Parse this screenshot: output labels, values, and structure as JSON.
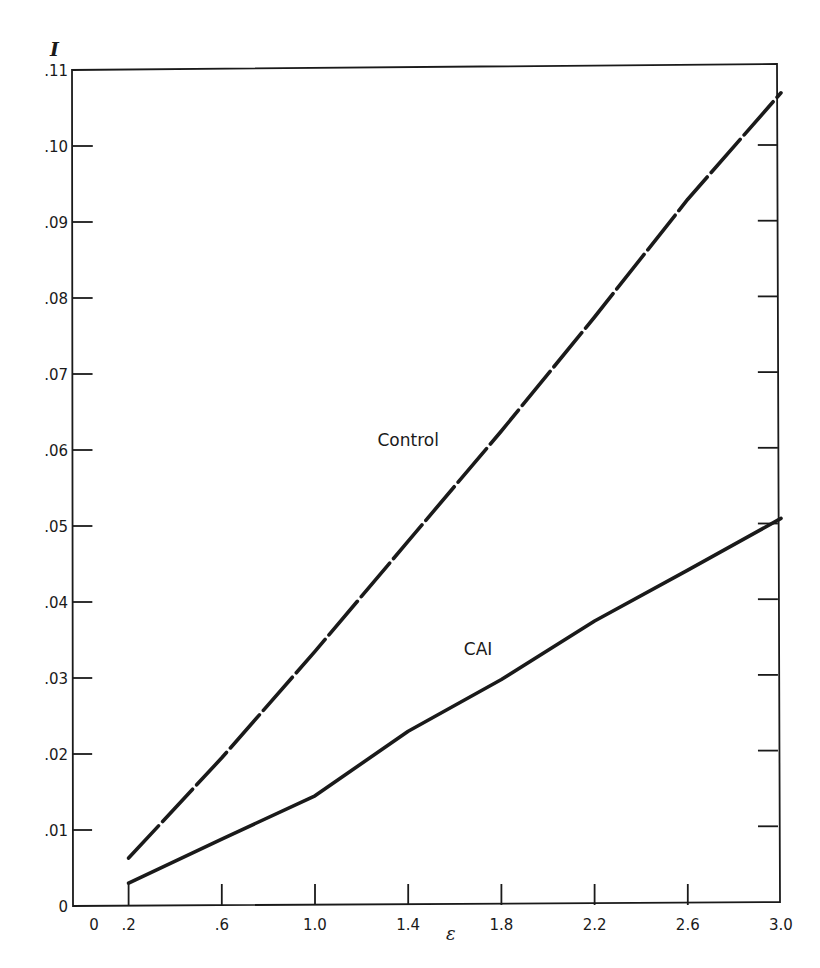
{
  "chart_data": {
    "type": "line",
    "title": "",
    "xlabel": "ε",
    "ylabel": "I",
    "xlim": [
      0,
      3.0
    ],
    "ylim": [
      0,
      0.11
    ],
    "grid": false,
    "legend": "inline labels",
    "x_ticks": [
      {
        "value": 0,
        "label": "0"
      },
      {
        "value": 0.2,
        "label": ".2"
      },
      {
        "value": 0.6,
        "label": ".6"
      },
      {
        "value": 1.0,
        "label": "1.0"
      },
      {
        "value": 1.4,
        "label": "1.4"
      },
      {
        "value": 1.8,
        "label": "1.8"
      },
      {
        "value": 2.2,
        "label": "2.2"
      },
      {
        "value": 2.6,
        "label": "2.6"
      },
      {
        "value": 3.0,
        "label": "3.0"
      }
    ],
    "y_ticks": [
      {
        "value": 0,
        "label": "0"
      },
      {
        "value": 0.01,
        "label": ".01"
      },
      {
        "value": 0.02,
        "label": ".02"
      },
      {
        "value": 0.03,
        "label": ".03"
      },
      {
        "value": 0.04,
        "label": ".04"
      },
      {
        "value": 0.05,
        "label": ".05"
      },
      {
        "value": 0.06,
        "label": ".06"
      },
      {
        "value": 0.07,
        "label": ".07"
      },
      {
        "value": 0.08,
        "label": ".08"
      },
      {
        "value": 0.09,
        "label": ".09"
      },
      {
        "value": 0.1,
        "label": ".10"
      },
      {
        "value": 0.11,
        "label": ".11"
      }
    ],
    "series": [
      {
        "name": "Control",
        "style": "dashed",
        "x": [
          0.2,
          0.6,
          1.0,
          1.4,
          1.8,
          2.2,
          2.6,
          3.0
        ],
        "values": [
          0.0063,
          0.0195,
          0.0335,
          0.048,
          0.0625,
          0.0775,
          0.093,
          0.107
        ],
        "label_position": {
          "x": 1.4,
          "y": 0.0605
        }
      },
      {
        "name": "CAI",
        "style": "solid",
        "x": [
          0.2,
          0.6,
          1.0,
          1.4,
          1.8,
          2.2,
          2.6,
          3.0
        ],
        "values": [
          0.003,
          0.0088,
          0.0145,
          0.023,
          0.0298,
          0.0375,
          0.0442,
          0.051
        ],
        "label_position": {
          "x": 1.7,
          "y": 0.033
        }
      }
    ],
    "colors": {
      "ink": "#1a1a1a",
      "background": "#ffffff"
    }
  }
}
